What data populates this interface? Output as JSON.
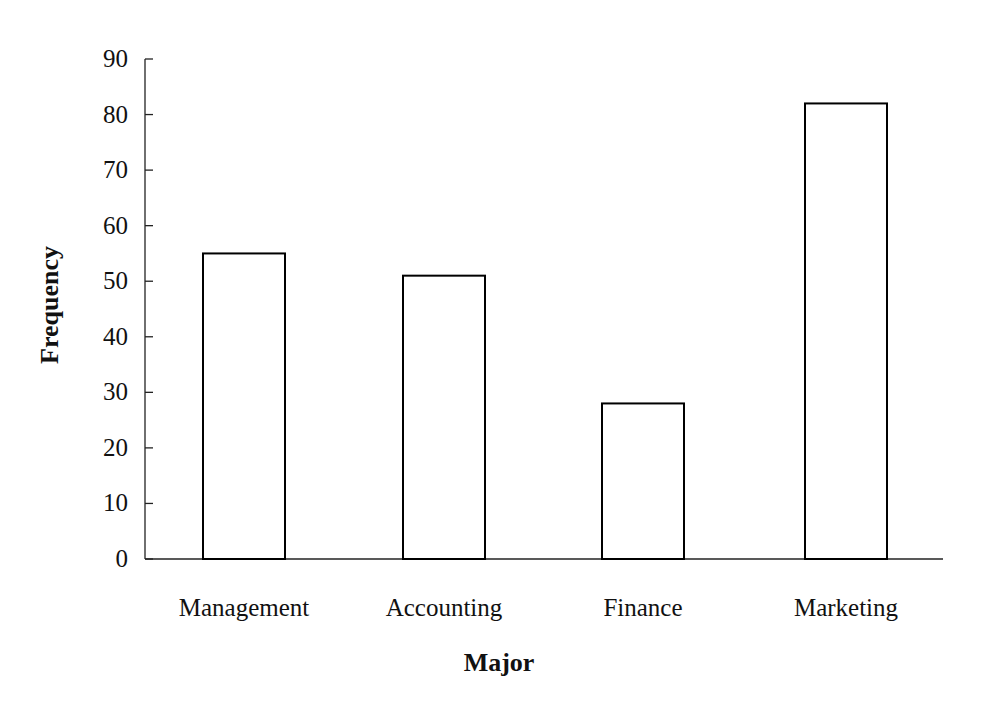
{
  "chart_data": {
    "type": "bar",
    "title": "",
    "xlabel": "Major",
    "ylabel": "Frequency",
    "categories": [
      "Management",
      "Accounting",
      "Finance",
      "Marketing"
    ],
    "values": [
      55,
      51,
      28,
      82
    ],
    "ylim": [
      0,
      90
    ],
    "yticks": [
      0,
      10,
      20,
      30,
      40,
      50,
      60,
      70,
      80,
      90
    ],
    "grid": false,
    "legend": null,
    "bar_fill": "#ffffff",
    "bar_stroke": "#000000"
  }
}
